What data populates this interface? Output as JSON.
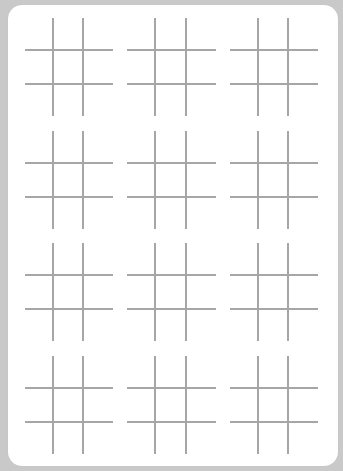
{
  "page": {
    "background_color": "#c9c9c9",
    "sheet_color": "#ffffff",
    "line_color": "#a6a6a6"
  },
  "grid": {
    "columns": 3,
    "rows": 4,
    "board_count": 12
  },
  "boards": [
    {
      "index": 1,
      "cells": [
        "",
        "",
        "",
        "",
        "",
        "",
        "",
        "",
        ""
      ]
    },
    {
      "index": 2,
      "cells": [
        "",
        "",
        "",
        "",
        "",
        "",
        "",
        "",
        ""
      ]
    },
    {
      "index": 3,
      "cells": [
        "",
        "",
        "",
        "",
        "",
        "",
        "",
        "",
        ""
      ]
    },
    {
      "index": 4,
      "cells": [
        "",
        "",
        "",
        "",
        "",
        "",
        "",
        "",
        ""
      ]
    },
    {
      "index": 5,
      "cells": [
        "",
        "",
        "",
        "",
        "",
        "",
        "",
        "",
        ""
      ]
    },
    {
      "index": 6,
      "cells": [
        "",
        "",
        "",
        "",
        "",
        "",
        "",
        "",
        ""
      ]
    },
    {
      "index": 7,
      "cells": [
        "",
        "",
        "",
        "",
        "",
        "",
        "",
        "",
        ""
      ]
    },
    {
      "index": 8,
      "cells": [
        "",
        "",
        "",
        "",
        "",
        "",
        "",
        "",
        ""
      ]
    },
    {
      "index": 9,
      "cells": [
        "",
        "",
        "",
        "",
        "",
        "",
        "",
        "",
        ""
      ]
    },
    {
      "index": 10,
      "cells": [
        "",
        "",
        "",
        "",
        "",
        "",
        "",
        "",
        ""
      ]
    },
    {
      "index": 11,
      "cells": [
        "",
        "",
        "",
        "",
        "",
        "",
        "",
        "",
        ""
      ]
    },
    {
      "index": 12,
      "cells": [
        "",
        "",
        "",
        "",
        "",
        "",
        "",
        "",
        ""
      ]
    }
  ]
}
